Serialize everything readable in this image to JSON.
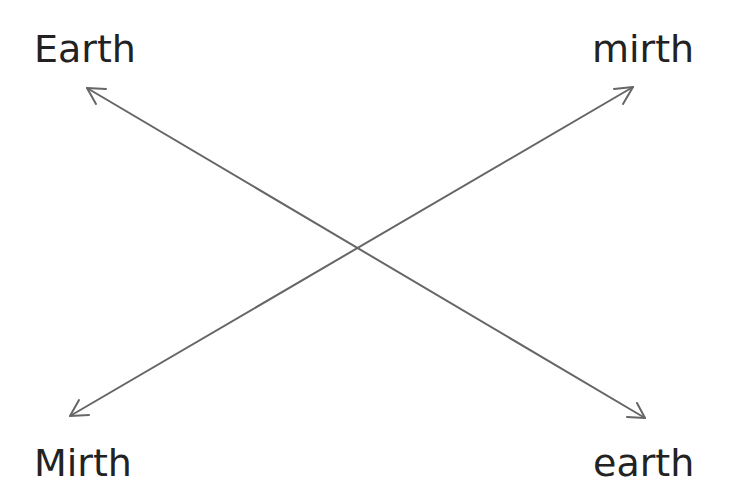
{
  "diagram": {
    "labels": {
      "top_left": "Earth",
      "top_right": "mirth",
      "bottom_left": "Mirth",
      "bottom_right": "earth"
    },
    "arrows": [
      {
        "name": "earth-arrow",
        "from": [
          645,
          418
        ],
        "to": [
          87,
          88
        ],
        "heads": "both"
      },
      {
        "name": "mirth-arrow",
        "from": [
          70,
          416
        ],
        "to": [
          633,
          87
        ],
        "heads": "both"
      }
    ],
    "line_color": "#666666"
  }
}
